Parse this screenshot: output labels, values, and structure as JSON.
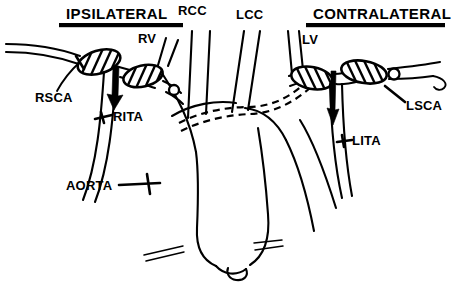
{
  "figure": {
    "width": 451,
    "height": 282,
    "background_color": "#ffffff",
    "line_color": "#000000"
  },
  "headers": {
    "left": "IPSILATERAL",
    "right": "CONTRALATERAL"
  },
  "labels": {
    "rsca": "RSCA",
    "rita": "RITA",
    "rv": "RV",
    "rcc": "RCC",
    "lcc": "LCC",
    "lv": "LV",
    "lsca": "LSCA",
    "lita": "LITA",
    "aorta": "AORTA"
  },
  "structures": [
    {
      "name": "right-subclavian-artery",
      "label": "RSCA",
      "side": "left"
    },
    {
      "name": "right-internal-thoracic-artery",
      "label": "RITA",
      "side": "left"
    },
    {
      "name": "right-vertebral-artery",
      "label": "RV",
      "side": "left"
    },
    {
      "name": "right-common-carotid-artery",
      "label": "RCC",
      "side": "center"
    },
    {
      "name": "left-common-carotid-artery",
      "label": "LCC",
      "side": "center"
    },
    {
      "name": "left-vertebral-artery",
      "label": "LV",
      "side": "right"
    },
    {
      "name": "left-subclavian-artery",
      "label": "LSCA",
      "side": "right"
    },
    {
      "name": "left-internal-thoracic-artery",
      "label": "LITA",
      "side": "right"
    },
    {
      "name": "aortic-arch",
      "label": "AORTA",
      "side": "center"
    }
  ],
  "annotations": {
    "stenosis_count": 4,
    "retrograde_arrows": 2,
    "catheter_dashed_path": "double-dashed line through aortic arch"
  }
}
